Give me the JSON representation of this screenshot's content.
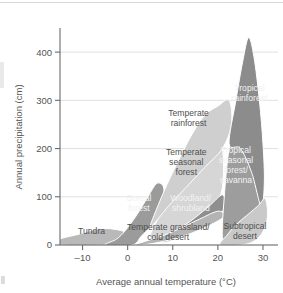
{
  "chart_data": {
    "type": "area",
    "title": "",
    "xlabel": "Average annual temperature (°C)",
    "ylabel": "Annual precipitation (cm)",
    "xlim": [
      -15,
      32
    ],
    "ylim": [
      0,
      450
    ],
    "xticks": [
      -10,
      0,
      10,
      20,
      30
    ],
    "xticklabels": [
      "–10",
      "0",
      "10",
      "20",
      "30"
    ],
    "yticks": [
      0,
      100,
      200,
      300,
      400
    ],
    "yticklabels": [
      "0",
      "100",
      "200",
      "300",
      "400"
    ],
    "grid": "horizontal",
    "legend": "none",
    "annotations": [
      {
        "label": "Tropical rainforest",
        "x": 27.0,
        "y": 310
      },
      {
        "label": "Temperate rainforest",
        "x": 13.5,
        "y": 258
      },
      {
        "label": "Temperate seasonal forest",
        "x": 13.0,
        "y": 165
      },
      {
        "label": "Tropical seasonal forest/savanna",
        "x": 24.0,
        "y": 160
      },
      {
        "label": "Boreal forest",
        "x": 2.5,
        "y": 80
      },
      {
        "label": "Woodland/shrubland",
        "x": 14.0,
        "y": 80
      },
      {
        "label": "Tundra",
        "x": -8.0,
        "y": 22
      },
      {
        "label": "Temperate grassland/cold desert",
        "x": 9.0,
        "y": 20
      },
      {
        "label": "Subtropical desert",
        "x": 26.0,
        "y": 22
      }
    ],
    "regions": [
      {
        "name": "Tundra",
        "fill": "#b9b9b9",
        "points": [
          [
            -15,
            0
          ],
          [
            -15,
            12
          ],
          [
            -11,
            22
          ],
          [
            -6,
            34
          ],
          [
            -1.5,
            30
          ],
          [
            0.5,
            18
          ],
          [
            -1,
            6
          ],
          [
            -4,
            0
          ]
        ]
      },
      {
        "name": "Boreal forest",
        "fill": "#9b9b9b",
        "points": [
          [
            -5,
            0
          ],
          [
            -2.5,
            12
          ],
          [
            -0.5,
            30
          ],
          [
            2,
            62
          ],
          [
            4.5,
            100
          ],
          [
            6.5,
            128
          ],
          [
            8,
            118
          ],
          [
            7.5,
            80
          ],
          [
            5.5,
            44
          ],
          [
            3,
            18
          ],
          [
            1,
            0
          ]
        ]
      },
      {
        "name": "Temperate seasonal forest",
        "fill": "#d6d6d6",
        "points": [
          [
            5,
            18
          ],
          [
            7,
            60
          ],
          [
            9.5,
            110
          ],
          [
            12,
            150
          ],
          [
            15,
            185
          ],
          [
            19,
            205
          ],
          [
            21,
            200
          ],
          [
            21,
            120
          ],
          [
            19,
            78
          ],
          [
            15,
            44
          ],
          [
            11,
            22
          ],
          [
            7,
            12
          ]
        ]
      },
      {
        "name": "Temperate rainforest",
        "fill": "#cfcfcf",
        "points": [
          [
            5,
            40
          ],
          [
            8,
            110
          ],
          [
            11,
            170
          ],
          [
            14,
            225
          ],
          [
            17,
            268
          ],
          [
            20,
            288
          ],
          [
            22.5,
            300
          ],
          [
            23,
            250
          ],
          [
            21,
            200
          ],
          [
            17,
            160
          ],
          [
            13,
            120
          ],
          [
            9,
            80
          ],
          [
            6,
            46
          ]
        ]
      },
      {
        "name": "Woodland/shrubland",
        "fill": "#8f8f8f",
        "points": [
          [
            7,
            10
          ],
          [
            10,
            26
          ],
          [
            14,
            50
          ],
          [
            18,
            80
          ],
          [
            21,
            104
          ],
          [
            21.5,
            78
          ],
          [
            19,
            52
          ],
          [
            15,
            30
          ],
          [
            11,
            14
          ],
          [
            8.5,
            6
          ]
        ]
      },
      {
        "name": "Temperate grassland/cold desert",
        "fill": "#b4b4b4",
        "points": [
          [
            1.5,
            0
          ],
          [
            4,
            8
          ],
          [
            8,
            20
          ],
          [
            12,
            36
          ],
          [
            16,
            54
          ],
          [
            20,
            70
          ],
          [
            21.5,
            60
          ],
          [
            18,
            40
          ],
          [
            14,
            24
          ],
          [
            10,
            12
          ],
          [
            6,
            4
          ],
          [
            3,
            0
          ]
        ]
      },
      {
        "name": "Tropical seasonal forest/savanna",
        "fill": "#9d9d9d",
        "points": [
          [
            21,
            16
          ],
          [
            21.5,
            110
          ],
          [
            22.5,
            200
          ],
          [
            24,
            248
          ],
          [
            26,
            262
          ],
          [
            28,
            250
          ],
          [
            29,
            200
          ],
          [
            29.5,
            120
          ],
          [
            29,
            60
          ],
          [
            27.5,
            26
          ],
          [
            25,
            12
          ],
          [
            22.5,
            10
          ]
        ]
      },
      {
        "name": "Tropical rainforest",
        "fill": "#8c8c8c",
        "points": [
          [
            22.5,
            210
          ],
          [
            24,
            300
          ],
          [
            25.5,
            380
          ],
          [
            26.8,
            430
          ],
          [
            28,
            390
          ],
          [
            29.2,
            300
          ],
          [
            30,
            210
          ],
          [
            30.3,
            130
          ],
          [
            29.6,
            80
          ],
          [
            27.5,
            150
          ],
          [
            25,
            200
          ]
        ]
      },
      {
        "name": "Subtropical desert",
        "fill": "#c9c9c9",
        "points": [
          [
            20.5,
            0
          ],
          [
            22,
            20
          ],
          [
            24,
            42
          ],
          [
            26.5,
            62
          ],
          [
            29,
            82
          ],
          [
            30.5,
            96
          ],
          [
            31,
            60
          ],
          [
            30,
            28
          ],
          [
            28,
            8
          ],
          [
            25,
            0
          ]
        ]
      }
    ]
  },
  "artifacts": {
    "top_rule": "horizontal-rule",
    "left_edge_mark": "cropped-element",
    "bottom_left_mark": "cropped-element"
  }
}
